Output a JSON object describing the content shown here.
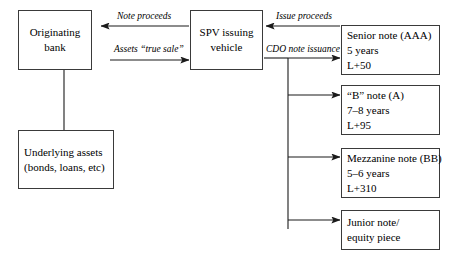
{
  "diagram": {
    "nodes": {
      "originating_bank": {
        "name": "Originating bank",
        "lines": [
          "Originating",
          "bank"
        ]
      },
      "underlying_assets": {
        "name": "Underlying assets",
        "lines": [
          "Underlying assets",
          "(bonds, loans, etc)"
        ]
      },
      "spv": {
        "name": "SPV issuing vehicle",
        "lines": [
          "SPV issuing",
          "vehicle"
        ]
      },
      "senior_note": {
        "name": "Senior note",
        "lines": [
          "Senior note (AAA)",
          "5 years",
          "L+50"
        ],
        "rating": "AAA",
        "maturity": "5 years",
        "spread": "L+50"
      },
      "b_note": {
        "name": "B note",
        "lines": [
          "“B” note (A)",
          "7–8 years",
          "L+95"
        ],
        "rating": "A",
        "maturity": "7–8 years",
        "spread": "L+95"
      },
      "mezzanine_note": {
        "name": "Mezzanine note",
        "lines": [
          "Mezzanine note (BB)",
          "5–6 years",
          "L+310"
        ],
        "rating": "BB",
        "maturity": "5–6 years",
        "spread": "L+310"
      },
      "junior_note": {
        "name": "Junior note / equity piece",
        "lines": [
          "Junior note/",
          "equity piece"
        ]
      }
    },
    "edge_labels": {
      "note_proceeds": "Note proceeds",
      "assets_true_sale": "Assets “true sale”",
      "issue_proceeds": "Issue proceeds",
      "cdo_note_issuance": "CDO note issuance"
    },
    "colors": {
      "box_border": "#3a3a3a",
      "connector": "#1a1a1a",
      "background": "#ffffff",
      "text": "#000000"
    }
  }
}
